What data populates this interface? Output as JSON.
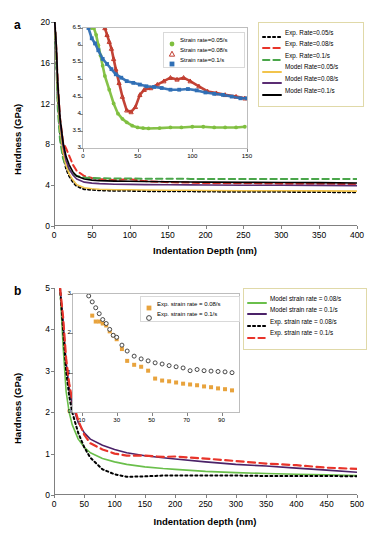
{
  "figure": {
    "panels": [
      "a",
      "b"
    ]
  },
  "panel_a": {
    "letter": "a",
    "axes": {
      "xlabel": "Indentation Depth (nm)",
      "ylabel": "Hardness (GPa)",
      "xticks": [
        0,
        50,
        100,
        150,
        200,
        250,
        300,
        350,
        400
      ],
      "yticks": [
        0,
        4,
        8,
        12,
        16,
        20
      ],
      "xlim": [
        0,
        400
      ],
      "ylim": [
        0,
        20
      ]
    },
    "legend": {
      "items": [
        {
          "label": "Exp. Rate=0.05/s",
          "color": "#000000",
          "style": "dotted"
        },
        {
          "label": "Exp. Rate=0.08/s",
          "color": "#e8342a",
          "style": "dashed"
        },
        {
          "label": "Exp. Rate=0.1/s",
          "color": "#4aa64a",
          "style": "dashed"
        },
        {
          "label": "Model Rate=0.05/s",
          "color": "#f2c44c",
          "style": "solid"
        },
        {
          "label": "Model Rate=0.08/s",
          "color": "#5b2d73",
          "style": "solid"
        },
        {
          "label": "Model Rate=0.1/s",
          "color": "#000000",
          "style": "solid"
        }
      ]
    },
    "inset": {
      "axes": {
        "xticks": [
          0,
          50,
          100,
          150
        ],
        "yticks": [
          3,
          3.5,
          4,
          4.5,
          5,
          5.5,
          6,
          6.5
        ],
        "ytick_labels": [
          "3",
          "3.5",
          "4",
          "4.5",
          "5",
          "5.5",
          "6",
          "6.5"
        ],
        "xlim": [
          0,
          150
        ],
        "ylim": [
          3,
          6.5
        ]
      },
      "legend": {
        "items": [
          {
            "label": "Strain rate=0.05/s",
            "color": "#7fbf3f",
            "marker": "circle"
          },
          {
            "label": "Strain rate=0.08/s",
            "color": "#c0392b",
            "marker": "triangle"
          },
          {
            "label": "Strain rate=0.1/s",
            "color": "#2f6fb5",
            "marker": "square"
          }
        ]
      }
    }
  },
  "panel_b": {
    "letter": "b",
    "axes": {
      "xlabel": "Indentation depth (nm)",
      "ylabel": "Hardness (GPa)",
      "xticks": [
        0,
        50,
        100,
        150,
        200,
        250,
        300,
        350,
        400,
        450,
        500
      ],
      "yticks": [
        0,
        1,
        2,
        3,
        4,
        5
      ],
      "xlim": [
        0,
        500
      ],
      "ylim": [
        0,
        5
      ]
    },
    "legend": {
      "items": [
        {
          "label": "Model strain rate = 0.08/s",
          "color": "#6abf4b",
          "style": "solid"
        },
        {
          "label": "Model strain rate = 0.1/s",
          "color": "#4b2268",
          "style": "solid"
        },
        {
          "label": "Exp. strain rate =  0.08/s",
          "color": "#000000",
          "style": "dotted"
        },
        {
          "label": "Exp. strain rate =  0.1/s",
          "color": "#e8342a",
          "style": "dashed"
        }
      ]
    },
    "inset": {
      "axes": {
        "xticks": [
          10,
          30,
          50,
          70,
          90
        ],
        "yticks": [
          0,
          1,
          2,
          3
        ],
        "xlim": [
          5,
          100
        ],
        "ylim": [
          0,
          3
        ]
      },
      "legend": {
        "items": [
          {
            "label": "Exp. strain rate =  0.08/s",
            "color": "#e8a33d",
            "marker": "square"
          },
          {
            "label": "Exp. strain rate =  0.1/s",
            "color": "#333333",
            "marker": "open-circle"
          }
        ]
      }
    }
  },
  "chart_data": [
    {
      "type": "line",
      "panel": "a",
      "title": "",
      "xlabel": "Indentation Depth (nm)",
      "ylabel": "Hardness (GPa)",
      "xlim": [
        0,
        400
      ],
      "ylim": [
        0,
        20
      ],
      "grid": false,
      "legend_position": "right",
      "x": [
        1,
        3,
        5,
        8,
        12,
        16,
        20,
        25,
        30,
        40,
        50,
        60,
        80,
        100,
        120,
        150,
        180,
        200,
        250,
        300,
        350,
        400
      ],
      "series": [
        {
          "name": "Exp. Rate=0.05/s",
          "color": "#000000",
          "style": "dotted",
          "values": [
            20,
            16.5,
            12.6,
            9.2,
            6.9,
            5.6,
            4.9,
            4.3,
            3.9,
            3.6,
            3.55,
            3.5,
            3.45,
            3.45,
            3.42,
            3.4,
            3.4,
            3.38,
            3.35,
            3.35,
            3.33,
            3.3
          ]
        },
        {
          "name": "Exp. Rate=0.08/s",
          "color": "#e8342a",
          "style": "dashed",
          "values": [
            20,
            17.5,
            14.0,
            10.6,
            8.2,
            7.6,
            6.9,
            6.0,
            5.4,
            4.9,
            4.7,
            4.6,
            4.5,
            4.6,
            4.4,
            4.3,
            4.25,
            4.2,
            4.2,
            4.15,
            4.15,
            4.1
          ]
        },
        {
          "name": "Exp. Rate=0.1/s",
          "color": "#4aa64a",
          "style": "dashed",
          "values": [
            20,
            16.0,
            11.5,
            8.4,
            6.6,
            5.9,
            5.5,
            5.1,
            4.9,
            4.75,
            4.7,
            4.68,
            4.66,
            4.65,
            4.64,
            4.63,
            4.62,
            4.62,
            4.6,
            4.6,
            4.6,
            4.6
          ]
        },
        {
          "name": "Model Rate=0.05/s",
          "color": "#f2c44c",
          "style": "solid",
          "values": [
            20,
            17.0,
            13.0,
            9.6,
            7.2,
            5.9,
            5.1,
            4.5,
            4.05,
            3.75,
            3.65,
            3.6,
            3.56,
            3.55,
            3.53,
            3.5,
            3.5,
            3.48,
            3.46,
            3.45,
            3.44,
            3.42
          ]
        },
        {
          "name": "Model Rate=0.08/s",
          "color": "#5b2d73",
          "style": "solid",
          "values": [
            20,
            17.5,
            13.6,
            10.2,
            7.8,
            6.4,
            5.6,
            5.0,
            4.6,
            4.3,
            4.2,
            4.15,
            4.1,
            4.08,
            4.06,
            4.04,
            4.03,
            4.02,
            4.0,
            4.0,
            3.98,
            3.96
          ]
        },
        {
          "name": "Model Rate=0.1/s",
          "color": "#000000",
          "style": "solid",
          "values": [
            20,
            17.8,
            14.0,
            10.6,
            8.2,
            6.8,
            6.0,
            5.3,
            4.9,
            4.6,
            4.5,
            4.45,
            4.4,
            4.38,
            4.36,
            4.34,
            4.32,
            4.3,
            4.28,
            4.26,
            4.25,
            4.22
          ]
        }
      ]
    },
    {
      "type": "scatter",
      "panel": "a-inset",
      "title": "",
      "xlabel": "",
      "ylabel": "",
      "xlim": [
        0,
        150
      ],
      "ylim": [
        3,
        6.5
      ],
      "grid": false,
      "legend_position": "top-right",
      "series": [
        {
          "name": "Strain rate=0.05/s",
          "color": "#7fbf3f",
          "marker": "circle",
          "x": [
            8,
            10,
            12,
            14,
            16,
            18,
            20,
            24,
            28,
            32,
            36,
            40,
            45,
            50,
            55,
            60,
            70,
            80,
            90,
            100,
            110,
            120,
            130,
            140,
            148
          ],
          "y": [
            6.5,
            6.5,
            6.3,
            6.0,
            5.7,
            5.4,
            5.1,
            4.7,
            4.3,
            4.0,
            3.85,
            3.75,
            3.65,
            3.6,
            3.58,
            3.57,
            3.58,
            3.6,
            3.6,
            3.62,
            3.62,
            3.6,
            3.6,
            3.6,
            3.62
          ]
        },
        {
          "name": "Strain rate=0.08/s",
          "color": "#c0392b",
          "marker": "triangle",
          "x": [
            20,
            22,
            24,
            26,
            28,
            30,
            33,
            36,
            40,
            44,
            48,
            52,
            56,
            62,
            68,
            74,
            80,
            86,
            92,
            98,
            106,
            114,
            122,
            130,
            140,
            148
          ],
          "y": [
            6.5,
            6.3,
            6.1,
            5.9,
            5.6,
            5.3,
            4.9,
            4.5,
            4.1,
            4.05,
            4.2,
            4.55,
            4.7,
            4.75,
            4.85,
            4.95,
            5.05,
            5.0,
            5.05,
            4.95,
            4.8,
            4.65,
            4.6,
            4.55,
            4.5,
            4.45
          ]
        },
        {
          "name": "Strain rate=0.1/s",
          "color": "#2f6fb5",
          "marker": "square",
          "x": [
            5,
            8,
            11,
            14,
            18,
            22,
            26,
            30,
            35,
            40,
            46,
            52,
            58,
            65,
            72,
            80,
            88,
            96,
            104,
            112,
            120,
            128,
            136,
            144,
            150
          ],
          "y": [
            6.5,
            6.2,
            6.05,
            5.85,
            5.6,
            5.45,
            5.3,
            5.15,
            5.05,
            4.95,
            4.9,
            4.85,
            4.8,
            4.78,
            4.75,
            4.7,
            4.7,
            4.72,
            4.68,
            4.62,
            4.58,
            4.55,
            4.5,
            4.45,
            4.45
          ]
        }
      ]
    },
    {
      "type": "line",
      "panel": "b",
      "title": "",
      "xlabel": "Indentation depth (nm)",
      "ylabel": "Hardness (GPa)",
      "xlim": [
        0,
        500
      ],
      "ylim": [
        0,
        5
      ],
      "grid": false,
      "legend_position": "right",
      "x": [
        10,
        15,
        20,
        25,
        30,
        40,
        50,
        60,
        80,
        100,
        120,
        150,
        180,
        200,
        250,
        300,
        350,
        400,
        450,
        500
      ],
      "series": [
        {
          "name": "Model strain rate = 0.08/s",
          "color": "#6abf4b",
          "style": "solid",
          "values": [
            5.0,
            3.6,
            2.5,
            2.0,
            1.7,
            1.35,
            1.15,
            1.02,
            0.88,
            0.8,
            0.74,
            0.68,
            0.64,
            0.62,
            0.57,
            0.54,
            0.52,
            0.5,
            0.49,
            0.47
          ]
        },
        {
          "name": "Model strain rate = 0.1/s",
          "color": "#4b2268",
          "style": "solid",
          "values": [
            5.0,
            4.2,
            3.2,
            2.6,
            2.2,
            1.75,
            1.5,
            1.35,
            1.2,
            1.1,
            1.02,
            0.95,
            0.9,
            0.87,
            0.8,
            0.74,
            0.7,
            0.65,
            0.6,
            0.55
          ]
        },
        {
          "name": "Exp. strain rate =  0.08/s",
          "color": "#000000",
          "style": "dotted",
          "values": [
            5.0,
            4.0,
            3.0,
            2.4,
            2.0,
            1.5,
            1.15,
            0.9,
            0.62,
            0.5,
            0.44,
            0.45,
            0.47,
            0.47,
            0.47,
            0.47,
            0.46,
            0.46,
            0.46,
            0.45
          ]
        },
        {
          "name": "Exp. strain rate =  0.1/s",
          "color": "#e8342a",
          "style": "dashed",
          "values": [
            5.0,
            4.3,
            3.3,
            2.7,
            2.3,
            1.8,
            1.45,
            1.25,
            1.1,
            1.0,
            0.95,
            0.95,
            0.92,
            0.93,
            0.88,
            0.82,
            0.76,
            0.72,
            0.66,
            0.63
          ]
        }
      ]
    },
    {
      "type": "scatter",
      "panel": "b-inset",
      "title": "",
      "xlabel": "",
      "ylabel": "",
      "xlim": [
        5,
        100
      ],
      "ylim": [
        0,
        3
      ],
      "grid": false,
      "legend_position": "top-right",
      "series": [
        {
          "name": "Exp. strain rate =  0.08/s",
          "color": "#e8a33d",
          "marker": "square",
          "x": [
            16,
            18,
            20,
            22,
            24,
            26,
            28,
            30,
            33,
            36,
            40,
            44,
            48,
            52,
            56,
            60,
            64,
            68,
            72,
            76,
            80,
            84,
            88,
            92,
            96
          ],
          "y": [
            2.45,
            2.3,
            2.3,
            2.25,
            2.2,
            2.05,
            1.95,
            1.85,
            1.6,
            1.3,
            1.2,
            1.15,
            1.05,
            0.85,
            0.8,
            0.78,
            0.75,
            0.72,
            0.7,
            0.68,
            0.65,
            0.63,
            0.6,
            0.58,
            0.55
          ]
        },
        {
          "name": "Exp. strain rate =  0.1/s",
          "color": "#333333",
          "marker": "open-circle",
          "x": [
            14,
            16,
            18,
            20,
            22,
            24,
            26,
            28,
            30,
            33,
            36,
            40,
            44,
            48,
            52,
            56,
            60,
            64,
            68,
            72,
            76,
            80,
            84,
            88,
            92,
            96
          ],
          "y": [
            2.95,
            2.8,
            2.65,
            2.5,
            2.35,
            2.25,
            2.1,
            1.95,
            1.9,
            1.7,
            1.55,
            1.42,
            1.35,
            1.3,
            1.25,
            1.22,
            1.18,
            1.15,
            1.12,
            1.05,
            1.08,
            1.05,
            1.04,
            1.03,
            1.02,
            1.0
          ]
        }
      ]
    }
  ]
}
